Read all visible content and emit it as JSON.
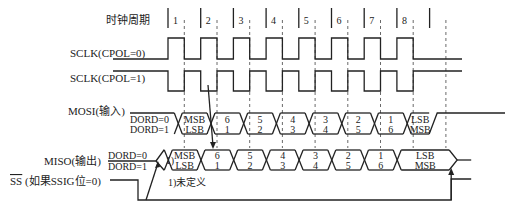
{
  "diagram": {
    "clock_period_label": "时钟周期",
    "clock_periods": [
      "1",
      "2",
      "3",
      "4",
      "5",
      "6",
      "7",
      "8"
    ],
    "signals": {
      "sclk_cpol0": "SCLK(CPOL=0)",
      "sclk_cpol1": "SCLK(CPOL=1)",
      "mosi": "MOSI(输入)",
      "miso": "MISO(输出)",
      "ss_bar": "SS",
      "ss_suffix": " (如果SSIG位=0)"
    },
    "dord0": "DORD=0",
    "dord1": "DORD=1",
    "mosi_cells": [
      {
        "top": "MSB",
        "bottom": "LSB"
      },
      {
        "top": "6",
        "bottom": "1"
      },
      {
        "top": "5",
        "bottom": "2"
      },
      {
        "top": "4",
        "bottom": "3"
      },
      {
        "top": "3",
        "bottom": "4"
      },
      {
        "top": "2",
        "bottom": "5"
      },
      {
        "top": "1",
        "bottom": "6"
      },
      {
        "top": "LSB",
        "bottom": "MSB"
      }
    ],
    "miso_pre": "1)",
    "miso_cells": [
      {
        "top": "MSB",
        "bottom": "LSB"
      },
      {
        "top": "6",
        "bottom": "1"
      },
      {
        "top": "5",
        "bottom": "2"
      },
      {
        "top": "4",
        "bottom": "3"
      },
      {
        "top": "3",
        "bottom": "4"
      },
      {
        "top": "2",
        "bottom": "5"
      },
      {
        "top": "1",
        "bottom": "6"
      },
      {
        "top": "LSB",
        "bottom": "MSB"
      }
    ],
    "footnote": "1)未定义"
  }
}
